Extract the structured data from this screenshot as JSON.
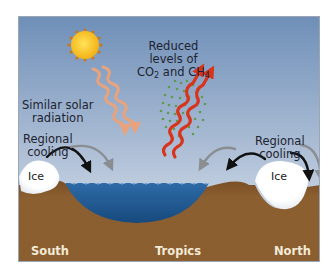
{
  "diagram": {
    "labels": {
      "solar": [
        "Similar solar",
        "radiation"
      ],
      "gases": {
        "line1": "Reduced",
        "line2": "levels of",
        "line3_parts": [
          "CO",
          "2",
          " and CH",
          "4"
        ]
      },
      "cooling_left": [
        "Regional",
        "cooling"
      ],
      "cooling_right": [
        "Regional",
        "cooling"
      ],
      "ice_left": "Ice",
      "ice_right": "Ice",
      "regions": [
        "South",
        "Tropics",
        "North"
      ]
    },
    "elements": {
      "sun": "sun-icon",
      "solar_arrows": "wavy-arrows-down (orange, 2)",
      "outgoing_arrows": "wavy-arrows-up (red, 2)",
      "gas_particles": "green-dots-cluster",
      "cooling_arrows_left": [
        "black-curved-arrow",
        "gray-curved-arrow"
      ],
      "cooling_arrows_right": [
        "black-curved-arrow-left",
        "gray-curved-arrow-left",
        "black-curved-arrow-right",
        "gray-curved-arrow-right"
      ]
    },
    "colors": {
      "sky_top": "#6f8fb8",
      "sky_bottom": "#dde6ef",
      "ground": "#8a5d2e",
      "ground_dark": "#6e4620",
      "water": "#1f5a93",
      "ice": "#ffffff",
      "sun": "#f7c21a",
      "solar_arrow": "#e9a37c",
      "red_arrow": "#d8341c",
      "gas_dots": "#5f9a4e"
    }
  }
}
